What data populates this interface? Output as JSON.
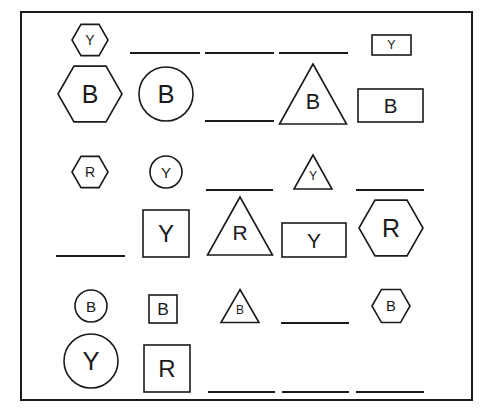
{
  "puzzle": {
    "frame": {
      "x": 21,
      "y": 12,
      "w": 451,
      "h": 388,
      "stroke": "#1a1a1a"
    },
    "cells": [
      {
        "id": "r1-top-1",
        "type": "hexagon",
        "label": "Y",
        "cx": 90,
        "cy": 40,
        "size": 18
      },
      {
        "id": "r1-top-2",
        "type": "blank",
        "x1": 130,
        "x2": 200,
        "y": 53
      },
      {
        "id": "r1-top-3",
        "type": "blank",
        "x1": 205,
        "x2": 274,
        "y": 53
      },
      {
        "id": "r1-top-4",
        "type": "blank",
        "x1": 279,
        "x2": 348,
        "y": 53
      },
      {
        "id": "r1-top-5",
        "type": "rect",
        "label": "Y",
        "x": 372,
        "y": 35,
        "w": 39,
        "h": 20
      },
      {
        "id": "r1-bot-1",
        "type": "hexagon",
        "label": "B",
        "cx": 90,
        "cy": 94,
        "size": 32
      },
      {
        "id": "r1-bot-2",
        "type": "circle",
        "label": "B",
        "cx": 166,
        "cy": 94,
        "r": 27
      },
      {
        "id": "r1-bot-3",
        "type": "blank",
        "x1": 205,
        "x2": 274,
        "y": 121
      },
      {
        "id": "r1-bot-4",
        "type": "triangle",
        "label": "B",
        "cx": 313,
        "cy": 94,
        "w": 67,
        "h": 60
      },
      {
        "id": "r1-bot-5",
        "type": "rect",
        "label": "B",
        "x": 358,
        "y": 89,
        "w": 65,
        "h": 33
      },
      {
        "id": "r2-top-1",
        "type": "hexagon",
        "label": "R",
        "cx": 90,
        "cy": 172,
        "size": 18
      },
      {
        "id": "r2-top-2",
        "type": "circle",
        "label": "Y",
        "cx": 166,
        "cy": 172,
        "r": 16
      },
      {
        "id": "r2-top-3",
        "type": "blank",
        "x1": 206,
        "x2": 273,
        "y": 190
      },
      {
        "id": "r2-top-4",
        "type": "triangle",
        "label": "Y",
        "cx": 313,
        "cy": 172,
        "w": 38,
        "h": 34
      },
      {
        "id": "r2-top-5",
        "type": "blank",
        "x1": 356,
        "x2": 424,
        "y": 190
      },
      {
        "id": "r2-bot-1",
        "type": "blank",
        "x1": 56,
        "x2": 125,
        "y": 256
      },
      {
        "id": "r2-bot-2",
        "type": "rect",
        "label": "Y",
        "x": 143,
        "y": 210,
        "w": 46,
        "h": 47
      },
      {
        "id": "r2-bot-3",
        "type": "triangle",
        "label": "R",
        "cx": 240,
        "cy": 226,
        "w": 65,
        "h": 58
      },
      {
        "id": "r2-bot-4",
        "type": "rect",
        "label": "Y",
        "x": 282,
        "y": 223,
        "w": 64,
        "h": 34
      },
      {
        "id": "r2-bot-5",
        "type": "hexagon",
        "label": "R",
        "cx": 391,
        "cy": 228,
        "size": 32
      },
      {
        "id": "r3-top-1",
        "type": "circle",
        "label": "B",
        "cx": 91,
        "cy": 306,
        "r": 16
      },
      {
        "id": "r3-top-2",
        "type": "rect",
        "label": "B",
        "x": 149,
        "y": 295,
        "w": 28,
        "h": 28
      },
      {
        "id": "r3-top-3",
        "type": "triangle",
        "label": "B",
        "cx": 240,
        "cy": 306,
        "w": 38,
        "h": 33
      },
      {
        "id": "r3-top-4",
        "type": "blank",
        "x1": 281,
        "x2": 349,
        "y": 323
      },
      {
        "id": "r3-top-5",
        "type": "hexagon",
        "label": "B",
        "cx": 391,
        "cy": 306,
        "size": 19
      },
      {
        "id": "r3-bot-1",
        "type": "circle",
        "label": "Y",
        "cx": 91,
        "cy": 361,
        "r": 27
      },
      {
        "id": "r3-bot-2",
        "type": "rect",
        "label": "R",
        "x": 144,
        "y": 345,
        "w": 46,
        "h": 47
      },
      {
        "id": "r3-bot-3",
        "type": "blank",
        "x1": 208,
        "x2": 275,
        "y": 392
      },
      {
        "id": "r3-bot-4",
        "type": "blank",
        "x1": 282,
        "x2": 349,
        "y": 392
      },
      {
        "id": "r3-bot-5",
        "type": "blank",
        "x1": 356,
        "x2": 424,
        "y": 392
      }
    ]
  }
}
